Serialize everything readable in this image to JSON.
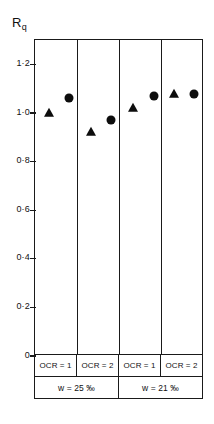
{
  "chart_data": {
    "type": "scatter",
    "title": "",
    "subtitle": "",
    "xlabel": "",
    "ylabel": "Rq",
    "ylabel_base": "R",
    "ylabel_sub": "q",
    "ylim": [
      0,
      1.3
    ],
    "grid": false,
    "legend_position": "none",
    "axis_tick_labels": [
      "1·2",
      "1·0",
      "0·8",
      "0·6",
      "0·4",
      "0·2",
      "0"
    ],
    "axis_tick_values": [
      1.2,
      1.0,
      0.8,
      0.6,
      0.4,
      0.2,
      0
    ],
    "categories": [
      "OCR = 1",
      "OCR = 2",
      "OCR = 1",
      "OCR = 2"
    ],
    "group_labels": [
      "w = 25 %",
      "w = 21 %"
    ],
    "group_spans": [
      2,
      2
    ],
    "series": [
      {
        "name": "triangle",
        "marker": "triangle",
        "color": "#0d0d0d",
        "values": [
          1.0,
          0.92,
          1.02,
          1.08
        ],
        "x_offsets": [
          0.33,
          0.33,
          0.33,
          0.28
        ]
      },
      {
        "name": "circle",
        "marker": "circle",
        "color": "#0d0d0d",
        "values": [
          1.06,
          0.97,
          1.07,
          1.08
        ],
        "x_offsets": [
          0.81,
          0.81,
          0.81,
          0.77
        ]
      }
    ],
    "annotations": []
  },
  "axis": {
    "ylabel_base": "R",
    "ylabel_sub": "q",
    "ticks": [
      {
        "label": "1·2",
        "value": 1.2
      },
      {
        "label": "1·0",
        "value": 1.0
      },
      {
        "label": "0·8",
        "value": 0.8
      },
      {
        "label": "0·6",
        "value": 0.6
      },
      {
        "label": "0·4",
        "value": 0.4
      },
      {
        "label": "0·2",
        "value": 0.2
      },
      {
        "label": "0",
        "value": 0
      }
    ]
  },
  "bottom_rows": {
    "ocr": [
      {
        "label": "OCR = 1"
      },
      {
        "label": "OCR = 2"
      },
      {
        "label": "OCR = 1"
      },
      {
        "label": "OCR = 2"
      }
    ],
    "water_content": [
      {
        "label": "w = 25 ‰"
      },
      {
        "label": "w = 21 ‰"
      }
    ]
  },
  "colors": {
    "marker": "#0d0d0d",
    "axis": "#1a1a1a",
    "background": "#ffffff"
  }
}
